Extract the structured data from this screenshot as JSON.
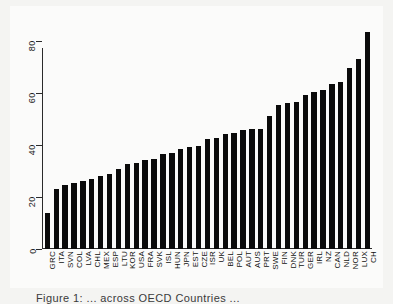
{
  "chart_data": {
    "type": "bar",
    "title": "",
    "xlabel": "",
    "ylabel": "",
    "ylim": [
      0,
      88
    ],
    "yticks": [
      0,
      20,
      40,
      60,
      80
    ],
    "grid": false,
    "legend": null,
    "bar_color": "#0b0b0b",
    "categories": [
      "GRC",
      "ITA",
      "SVN",
      "COL",
      "LVA",
      "CHL",
      "MEX",
      "ESP",
      "LTU",
      "KOR",
      "USA",
      "FRA",
      "SVK",
      "ISL",
      "HUN",
      "JPN",
      "EST",
      "CZE",
      "ISR",
      "UK",
      "BEL",
      "POL",
      "AUT",
      "AUS",
      "PRT",
      "SWE",
      "FIN",
      "DNK",
      "TUR",
      "GER",
      "IRL",
      "NZ",
      "CAN",
      "NLD",
      "NOR",
      "LUX",
      "CH"
    ],
    "values": [
      14.0,
      23.2,
      24.5,
      25.4,
      26.2,
      26.8,
      27.9,
      28.8,
      30.8,
      32.8,
      33.2,
      34.2,
      34.4,
      36.4,
      37.0,
      38.6,
      39.3,
      39.7,
      42.2,
      42.8,
      44.2,
      44.5,
      45.8,
      46.2,
      46.2,
      51.3,
      55.3,
      56.2,
      56.5,
      59.0,
      60.2,
      61.2,
      63.4,
      64.1,
      69.5,
      73.0,
      83.3
    ]
  },
  "caption": {
    "text": "Figure 1:  ... across OECD Countries ..."
  },
  "axis": {
    "y_tick_labels": [
      "0",
      "20",
      "40",
      "60",
      "80"
    ]
  }
}
